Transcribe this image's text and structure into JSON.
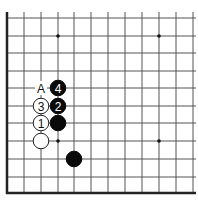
{
  "board": {
    "view": "lower-left corner",
    "columns_x": [
      7,
      24,
      41,
      58,
      74,
      91,
      108,
      125,
      142,
      159,
      176,
      193
    ],
    "rows_y": [
      18,
      36,
      53,
      71,
      88,
      106,
      123,
      141,
      159,
      177,
      193
    ],
    "top_y": 12,
    "right_x": 196,
    "edges": [
      "left",
      "bottom"
    ],
    "colors": {
      "grid": "#555555",
      "edge": "#222222",
      "black_stone": "#0a0a0a",
      "white_stone": "#ffffff"
    }
  },
  "star_points": [
    {
      "x": 58,
      "y": 36
    },
    {
      "x": 159,
      "y": 36
    },
    {
      "x": 58,
      "y": 141
    },
    {
      "x": 159,
      "y": 141
    }
  ],
  "stones": [
    {
      "color": "black",
      "x": 58,
      "y": 88,
      "label": "4"
    },
    {
      "color": "white",
      "x": 41,
      "y": 106,
      "label": "3"
    },
    {
      "color": "black",
      "x": 58,
      "y": 106,
      "label": "2"
    },
    {
      "color": "white",
      "x": 41,
      "y": 123,
      "label": "1"
    },
    {
      "color": "black",
      "x": 58,
      "y": 123,
      "label": ""
    },
    {
      "color": "white",
      "x": 41,
      "y": 141,
      "label": ""
    },
    {
      "color": "black",
      "x": 74,
      "y": 159,
      "label": ""
    }
  ],
  "markers": [
    {
      "x": 41,
      "y": 88,
      "label": "A"
    }
  ]
}
